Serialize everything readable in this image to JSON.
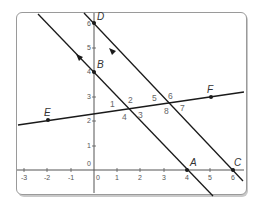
{
  "diagram": {
    "type": "coordinate-geometry",
    "axes": {
      "x_ticks": [
        "-3",
        "-2",
        "-1",
        "0",
        "1",
        "2",
        "3",
        "4",
        "5",
        "6"
      ],
      "y_ticks": [
        "0",
        "1",
        "2",
        "3",
        "4",
        "5",
        "6"
      ]
    },
    "points": {
      "A": {
        "label": "A",
        "x": 4,
        "y": 0
      },
      "B": {
        "label": "B",
        "x": 0,
        "y": 4
      },
      "C": {
        "label": "C",
        "x": 6,
        "y": 0
      },
      "D": {
        "label": "D",
        "x": 0,
        "y": 6
      },
      "E": {
        "label": "E",
        "x": -2,
        "y": 2
      },
      "F": {
        "label": "F",
        "x": 5,
        "y": 3
      }
    },
    "lines": [
      {
        "name": "line-BA",
        "through": [
          "B",
          "A"
        ],
        "parallel_marker": true
      },
      {
        "name": "line-DC",
        "through": [
          "D",
          "C"
        ],
        "parallel_marker": true
      },
      {
        "name": "transversal-EF",
        "through": [
          "E",
          "F"
        ]
      }
    ],
    "angle_labels": [
      "1",
      "2",
      "3",
      "4",
      "5",
      "6",
      "7",
      "8"
    ],
    "colors": {
      "line": "#1a1a1a",
      "axis": "#555555",
      "frame_border": "#9a9a9a",
      "label": "#333333"
    }
  }
}
